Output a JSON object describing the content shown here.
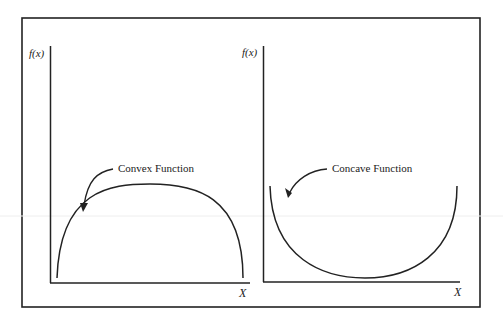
{
  "diagram": {
    "panels": [
      {
        "y_axis_label": "f(x)",
        "x_axis_label": "X",
        "curve_label": "Convex Function",
        "curve_shape": "arch (opens downward)"
      },
      {
        "y_axis_label": "f(x)",
        "x_axis_label": "X",
        "curve_label": "Concave Function",
        "curve_shape": "bowl (opens upward)"
      }
    ],
    "colors": {
      "ink": "#222222",
      "background": "#ffffff"
    }
  }
}
